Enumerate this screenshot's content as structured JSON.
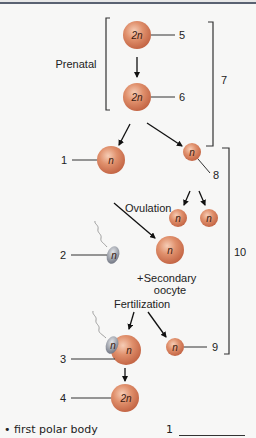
{
  "diagram": {
    "stage_labels": {
      "prenatal": "Prenatal",
      "ovulation": "Ovulation",
      "fertilization": "Fertilization",
      "secondary_oocyte_line1": "Secondary",
      "secondary_oocyte_line2": "oocyte",
      "plus": "+"
    },
    "cells": {
      "c5": "2n",
      "c6": "2n",
      "c1": "n",
      "c8": "n",
      "c_split_a": "n",
      "c_split_b": "n",
      "c_secondary": "n",
      "c_sperm": "n",
      "c3_sperm": "n",
      "c3_egg": "n",
      "c9": "n",
      "c4": "2n"
    },
    "callouts": {
      "n1": "1",
      "n2": "2",
      "n3": "3",
      "n4": "4",
      "n5": "5",
      "n6": "6",
      "n7": "7",
      "n8": "8",
      "n9": "9",
      "n10": "10"
    },
    "colors": {
      "cell_fill": "#d9805e",
      "cell_highlight": "#f3c2a8",
      "cell_edge": "#b85a3c",
      "sperm_fill": "#9a9ea6",
      "background": "#f7f7f6",
      "line": "#222222"
    }
  },
  "question": {
    "bullet": "•",
    "term": "first polar body",
    "answer_number": "1"
  }
}
